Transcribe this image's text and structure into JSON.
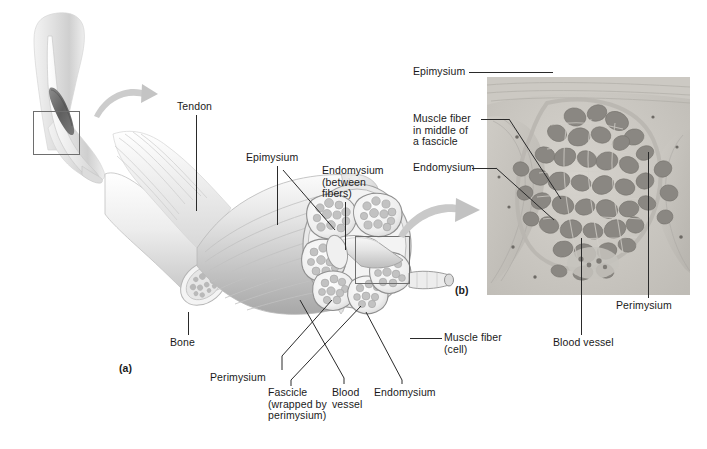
{
  "figure": {
    "background_color": "#ffffff",
    "label_color": "#1a1a1a",
    "leader_color": "#2a2a2a",
    "arrow_color": "#b9b9b9"
  },
  "panel_a": {
    "tag": "(a)",
    "labels": {
      "tendon": "Tendon",
      "epimysium": "Epimysium",
      "endomysium_between_fibers": "Endomysium\n(between\nfibers)",
      "bone": "Bone",
      "perimysium": "Perimysium",
      "fascicle": "Fascicle\n(wrapped by\nperimysium)",
      "blood_vessel": "Blood\nvessel",
      "endomysium": "Endomysium",
      "muscle_fiber_cell": "Muscle fiber\n(cell)"
    }
  },
  "panel_b": {
    "tag": "(b)",
    "labels": {
      "epimysium": "Epimysium",
      "muscle_fiber_in_fascicle": "Muscle fiber\nin middle of\na fascicle",
      "endomysium": "Endomysium",
      "blood_vessel": "Blood vessel",
      "perimysium": "Perimysium"
    }
  },
  "inset": {
    "description": "arm-with-biceps-inset",
    "selection_box": "region-of-interest"
  },
  "icons": {
    "arrow_inset_to_muscle": "curved-arrow-icon",
    "arrow_muscle_to_micrograph": "curved-arrow-icon"
  }
}
